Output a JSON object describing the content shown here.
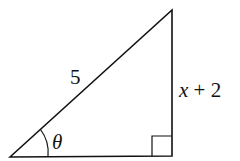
{
  "diagram": {
    "type": "right-triangle",
    "hypotenuse_label": "5",
    "vertical_leg_label_var": "x",
    "vertical_leg_label_rest": " + 2",
    "angle_label": "θ",
    "stroke_color": "#111111",
    "background": "#ffffff"
  }
}
